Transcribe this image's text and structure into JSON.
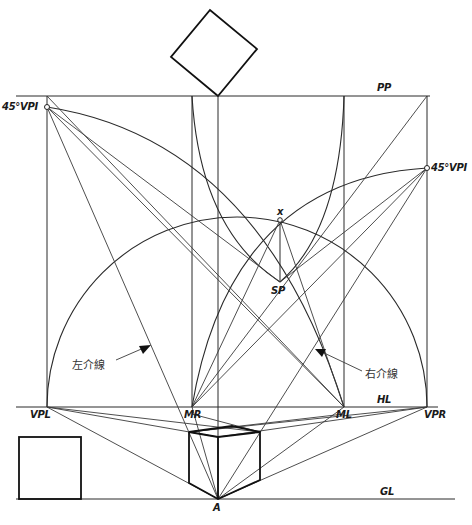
{
  "diagram": {
    "labels": {
      "pp": "PP",
      "hl": "HL",
      "gl": "GL",
      "vpl": "VPL",
      "vpr": "VPR",
      "mr": "MR",
      "ml": "ML",
      "sp": "SP",
      "x": "x",
      "a": "A",
      "vpi_left": "45°VPI",
      "vpi_right": "45°VPI"
    },
    "annotations": {
      "left_diagonal": "左介線",
      "right_diagonal": "右介線"
    },
    "colors": {
      "line": "#2a2a2a",
      "background": "#ffffff"
    }
  }
}
